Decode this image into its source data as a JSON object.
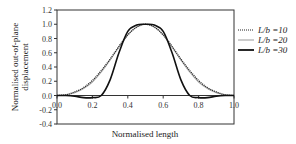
{
  "chart_data": {
    "type": "line",
    "title": "",
    "xlabel": "Normalised length",
    "ylabel": "Normalised out-of-plane displacement",
    "ylabel_lines": [
      "Normalised out-of-plane",
      "displacement"
    ],
    "xlim": [
      0,
      1
    ],
    "ylim": [
      -0.4,
      1.2
    ],
    "x_ticks": [
      0.0,
      0.2,
      0.4,
      0.6,
      0.8,
      1.0
    ],
    "x_tick_labels": [
      "0.0",
      "0.2",
      "0.4",
      "0.6",
      "0.8",
      "1.0"
    ],
    "y_ticks": [
      -0.4,
      -0.2,
      0.0,
      0.2,
      0.4,
      0.6,
      0.8,
      1.0,
      1.2
    ],
    "y_tick_labels": [
      "-0.4",
      "-0.2",
      "0.0",
      "0.2",
      "0.4",
      "0.6",
      "0.8",
      "1.0",
      "1.2"
    ],
    "grid": false,
    "legend_position": "right",
    "x": [
      0.0,
      0.05,
      0.1,
      0.15,
      0.2,
      0.25,
      0.3,
      0.35,
      0.4,
      0.45,
      0.5,
      0.55,
      0.6,
      0.65,
      0.7,
      0.75,
      0.8,
      0.85,
      0.9,
      0.95,
      1.0
    ],
    "series": [
      {
        "name": "L/b =10",
        "style": "dotted",
        "color": "#222222",
        "values": [
          0.0,
          0.01,
          0.05,
          0.11,
          0.21,
          0.35,
          0.51,
          0.69,
          0.85,
          0.96,
          1.0,
          0.96,
          0.85,
          0.69,
          0.51,
          0.35,
          0.21,
          0.11,
          0.05,
          0.01,
          0.0
        ]
      },
      {
        "name": "L/b =20",
        "style": "solid",
        "color": "#aaaaaa",
        "values": [
          0.0,
          0.01,
          0.04,
          0.1,
          0.19,
          0.33,
          0.5,
          0.68,
          0.85,
          0.96,
          1.0,
          0.96,
          0.85,
          0.68,
          0.5,
          0.33,
          0.19,
          0.1,
          0.04,
          0.01,
          0.0
        ]
      },
      {
        "name": "L/b =30",
        "style": "solid-thick",
        "color": "#111111",
        "values": [
          0.0,
          0.0,
          -0.01,
          -0.03,
          -0.03,
          0.0,
          0.22,
          0.6,
          0.9,
          0.99,
          1.0,
          0.99,
          0.9,
          0.6,
          0.22,
          0.0,
          -0.03,
          -0.03,
          -0.01,
          0.0,
          0.0
        ]
      }
    ]
  },
  "legend": {
    "items": [
      {
        "label": "L/b =10"
      },
      {
        "label": "L/b =20"
      },
      {
        "label": "L/b =30"
      }
    ]
  }
}
